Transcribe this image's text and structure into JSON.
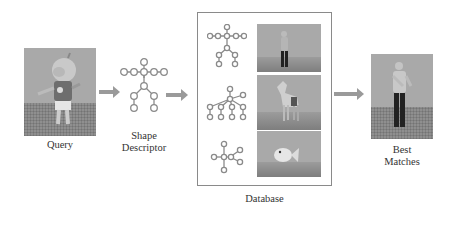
{
  "diagram": {
    "type": "pipeline",
    "stages": [
      {
        "id": "query",
        "label": "Query",
        "content": "3D model render of a cartoon character standing on a grid floor"
      },
      {
        "id": "shape_descriptor",
        "label_lines": [
          "Shape",
          "Descriptor"
        ],
        "content": "skeletal graph of circular nodes"
      },
      {
        "id": "database",
        "label": "Database",
        "entries": [
          {
            "graph": "skeletal graph (humanoid)",
            "model": "human figure"
          },
          {
            "graph": "tree graph (quadruped)",
            "model": "horse"
          },
          {
            "graph": "star graph",
            "model": "fish"
          }
        ]
      },
      {
        "id": "best_matches",
        "label_lines": [
          "Best",
          "Matches"
        ],
        "content": "human figure model render"
      }
    ],
    "edges": [
      {
        "from": "query",
        "to": "shape_descriptor"
      },
      {
        "from": "shape_descriptor",
        "to": "database"
      },
      {
        "from": "database",
        "to": "best_matches"
      }
    ],
    "colors": {
      "arrow": "#9a9a9a",
      "node_stroke": "#8a8a8a",
      "render_bg": "#a9a9a9",
      "box_border": "#8a8a8a"
    }
  }
}
